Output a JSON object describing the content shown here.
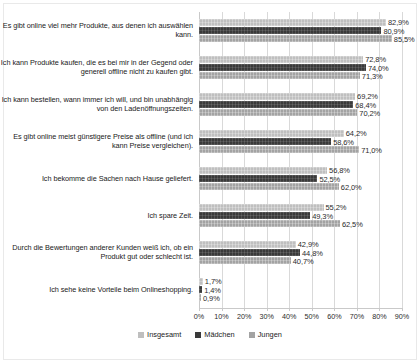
{
  "chart_data": {
    "type": "bar",
    "orientation": "horizontal",
    "title": "",
    "xlabel": "",
    "ylabel": "",
    "xlim": [
      0,
      90
    ],
    "xtick_labels": [
      "0%",
      "10%",
      "20%",
      "30%",
      "40%",
      "50%",
      "60%",
      "70%",
      "80%",
      "90%"
    ],
    "xtick_values": [
      0,
      10,
      20,
      30,
      40,
      50,
      60,
      70,
      80,
      90
    ],
    "grid": true,
    "legend_position": "bottom",
    "value_suffix": "%",
    "decimal_separator": ",",
    "categories": [
      "Es gibt online viel mehr Produkte, aus denen ich auswählen kann.",
      "Ich kann Produkte kaufen, die es bei mir in der Gegend oder generell offline nicht zu kaufen gibt.",
      "Ich kann bestellen, wann immer ich will, und bin unabhängig von den Ladenöffnungszeiten.",
      "Es gibt online meist günstigere Preise als offline (und ich kann Preise vergleichen).",
      "Ich bekomme die Sachen nach Hause geliefert.",
      "Ich spare Zeit.",
      "Durch die Bewertungen anderer Kunden weiß ich, ob ein Produkt gut oder schlecht ist.",
      "Ich sehe keine Vorteile beim Onlineshopping."
    ],
    "series": [
      {
        "name": "Insgesamt",
        "color": "#bfbfbf",
        "values": [
          82.9,
          72.8,
          69.2,
          64.2,
          56.8,
          55.2,
          42.9,
          1.7
        ],
        "labels": [
          "82,9%",
          "72,8%",
          "69,2%",
          "64,2%",
          "56,8%",
          "55,2%",
          "42,9%",
          "1,7%"
        ]
      },
      {
        "name": "Mädchen",
        "color": "#3a3a3a",
        "values": [
          80.9,
          74.0,
          68.4,
          58.6,
          52.5,
          49.3,
          44.8,
          1.4
        ],
        "labels": [
          "80,9%",
          "74,0%",
          "68,4%",
          "58,6%",
          "52,5%",
          "49,3%",
          "44,8%",
          "1,4%"
        ]
      },
      {
        "name": "Jungen",
        "color": "#a3a3a3",
        "values": [
          85.5,
          71.3,
          70.2,
          71.0,
          62.0,
          62.5,
          40.7,
          0.9
        ],
        "labels": [
          "85,5%",
          "71,3%",
          "70,2%",
          "71,0%",
          "62,0%",
          "62,5%",
          "40,7%",
          "0,9%"
        ]
      }
    ]
  }
}
